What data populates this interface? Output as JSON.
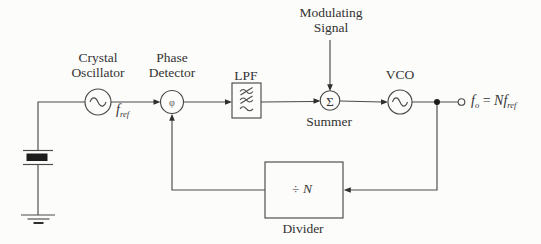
{
  "colors": {
    "line": "#4a4a4a",
    "text": "#333333",
    "background": "#fcfcfa",
    "crystal_fill": "#1c1c1c"
  },
  "blocks": {
    "crystal_oscillator": {
      "line1": "Crystal",
      "line2": "Oscillator"
    },
    "phase_detector": {
      "line1": "Phase",
      "line2": "Detector",
      "symbol": "φ"
    },
    "lpf": {
      "label": "LPF"
    },
    "modulating_signal": {
      "line1": "Modulating",
      "line2": "Signal"
    },
    "summer": {
      "label": "Summer",
      "symbol": "Σ"
    },
    "vco": {
      "label": "VCO"
    },
    "divider": {
      "label": "Divider",
      "symbol_op": "÷ ",
      "symbol_var": "N"
    }
  },
  "signals": {
    "f_ref": {
      "base": "f",
      "sub": "ref"
    },
    "output": {
      "f1": "f",
      "sub1": "o",
      "eq": " = ",
      "n": "N",
      "f2": "f",
      "sub2": "ref"
    }
  },
  "icons": {
    "crystal_oscillator": "sine-wave-icon",
    "vco": "sine-wave-icon",
    "lpf": "lowpass-filter-icon",
    "crystal": "quartz-crystal-icon",
    "ground": "ground-icon",
    "output_terminal": "open-circle-terminal",
    "junction": "junction-dot"
  }
}
